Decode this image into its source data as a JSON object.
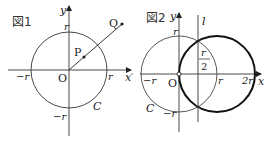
{
  "figure1": {
    "caption": "図1",
    "axis_x": "x",
    "axis_y": "y",
    "origin": "O",
    "tick_r_x": "r",
    "tick_neg_r_x": "−r",
    "tick_r_y": "r",
    "tick_neg_r_y": "−r",
    "circle_label": "C",
    "point_p": "P",
    "point_q": "Q"
  },
  "figure2": {
    "caption": "図2",
    "axis_x": "x",
    "axis_y": "y",
    "origin": "O",
    "line_label": "l",
    "tick_r_x": "r",
    "tick_2r_x": "2r",
    "tick_neg_r_x": "−r",
    "tick_r_y": "r",
    "tick_neg_r_y": "−r",
    "half_r_num": "r",
    "half_r_den": "2",
    "circle_label": "C"
  },
  "colors": {
    "stroke": "#222222",
    "thin_stroke": "#444444"
  }
}
